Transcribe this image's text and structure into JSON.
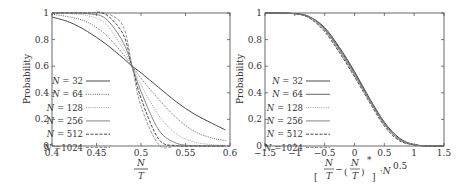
{
  "chart_data": [
    {
      "type": "line",
      "title": "",
      "xlabel": "N / T",
      "ylabel": "Probability",
      "xlim": [
        0.4,
        0.6
      ],
      "ylim": [
        0,
        1
      ],
      "xticks": [
        "0.4",
        "0.45",
        "0.5",
        "0.55",
        "0.6"
      ],
      "yticks": [
        "0",
        "0.2",
        "0.4",
        "0.6",
        "0.8",
        "1"
      ],
      "grid": false,
      "legend_position": "lower left",
      "x": [
        0.4,
        0.42,
        0.44,
        0.46,
        0.48,
        0.49,
        0.5,
        0.52,
        0.54,
        0.56,
        0.58,
        0.595
      ],
      "series": [
        {
          "name": "N = 32",
          "style": "solid",
          "color": "#333333",
          "values": [
            0.97,
            0.93,
            0.86,
            0.77,
            0.66,
            0.6,
            0.55,
            0.44,
            0.33,
            0.24,
            0.17,
            0.12
          ]
        },
        {
          "name": "N = 64",
          "style": "dotted",
          "color": "#555555",
          "values": [
            0.99,
            0.97,
            0.93,
            0.84,
            0.69,
            0.6,
            0.51,
            0.35,
            0.21,
            0.11,
            0.06,
            0.04
          ]
        },
        {
          "name": "N = 128",
          "style": "dotted",
          "color": "#999999",
          "values": [
            1.0,
            0.995,
            0.98,
            0.92,
            0.73,
            0.6,
            0.46,
            0.23,
            0.09,
            0.03,
            0.01,
            0.005
          ]
        },
        {
          "name": "N = 256",
          "style": "solid",
          "color": "#777777",
          "values": [
            1.0,
            1.0,
            0.995,
            0.96,
            0.78,
            0.6,
            0.41,
            0.12,
            0.02,
            0.003,
            0.0,
            0.0
          ]
        },
        {
          "name": "N = 512",
          "style": "dashed",
          "color": "#333333",
          "values": [
            1.0,
            1.0,
            1.0,
            0.99,
            0.84,
            0.6,
            0.36,
            0.05,
            0.003,
            0.0,
            0.0,
            0.0
          ]
        },
        {
          "name": "N = 1024",
          "style": "dashed",
          "color": "#888888",
          "values": [
            1.0,
            1.0,
            1.0,
            1.0,
            0.9,
            0.6,
            0.3,
            0.01,
            0.0,
            0.0,
            0.0,
            0.0
          ]
        }
      ]
    },
    {
      "type": "line",
      "title": "",
      "xlabel": "[ N/T − (N/T)* ] · N^0.5",
      "ylabel": "Probability",
      "xlim": [
        -1.5,
        1.5
      ],
      "ylim": [
        0,
        1
      ],
      "xticks": [
        "−1.5",
        "−1",
        "−0.5",
        "0",
        "0.5",
        "1",
        "1.5"
      ],
      "yticks": [
        "0",
        "0.2",
        "0.4",
        "0.6",
        "0.8",
        "1"
      ],
      "grid": false,
      "legend_position": "lower left",
      "x": [
        -1.5,
        -1.0,
        -0.75,
        -0.5,
        -0.25,
        0.0,
        0.25,
        0.5,
        0.75,
        1.0,
        1.25,
        1.5
      ],
      "series": [
        {
          "name": "N = 32",
          "style": "solid",
          "color": "#333333",
          "values": [
            1.0,
            0.995,
            0.97,
            0.89,
            0.74,
            0.56,
            0.36,
            0.18,
            0.06,
            0.01,
            0.0,
            0.0
          ]
        },
        {
          "name": "N = 64",
          "style": "solid",
          "color": "#555555",
          "values": [
            1.0,
            0.995,
            0.97,
            0.88,
            0.73,
            0.55,
            0.35,
            0.17,
            0.05,
            0.01,
            0.0,
            0.0
          ]
        },
        {
          "name": "N = 128",
          "style": "dotted",
          "color": "#999999",
          "values": [
            1.0,
            0.995,
            0.96,
            0.87,
            0.71,
            0.53,
            0.34,
            0.16,
            0.05,
            0.01,
            0.0,
            0.0
          ]
        },
        {
          "name": "N = 256",
          "style": "solid",
          "color": "#777777",
          "values": [
            1.0,
            0.995,
            0.97,
            0.88,
            0.72,
            0.54,
            0.35,
            0.17,
            0.05,
            0.01,
            0.0,
            0.0
          ]
        },
        {
          "name": "N = 512",
          "style": "dashed",
          "color": "#333333",
          "values": [
            1.0,
            0.995,
            0.96,
            0.86,
            0.7,
            0.52,
            0.33,
            0.15,
            0.04,
            0.01,
            0.0,
            0.0
          ]
        },
        {
          "name": "N = 1024",
          "style": "dashed",
          "color": "#888888",
          "values": [
            1.0,
            0.995,
            0.96,
            0.87,
            0.71,
            0.53,
            0.34,
            0.16,
            0.05,
            0.01,
            0.0,
            0.0
          ]
        }
      ]
    }
  ],
  "panels": {
    "left": {
      "ylabel": "Probability",
      "xlabel_num": "N",
      "xlabel_den": "T",
      "legend": [
        {
          "prefix": "N",
          "text": " = 32"
        },
        {
          "prefix": "N",
          "text": " = 64"
        },
        {
          "prefix": "N",
          "text": " = 128"
        },
        {
          "prefix": "N",
          "text": " = 256"
        },
        {
          "prefix": "N",
          "text": " = 512"
        },
        {
          "prefix": "N",
          "text": " =1024"
        }
      ]
    },
    "right": {
      "ylabel": "Probability",
      "xlabel_parts": {
        "frac1_num": "N",
        "frac1_den": "T",
        "minus": "−",
        "frac2_num": "N",
        "frac2_den": "T",
        "star": "*",
        "suffix_base": "·N",
        "suffix_exp": "0.5"
      },
      "legend": [
        {
          "prefix": "N",
          "text": " = 32"
        },
        {
          "prefix": "N",
          "text": " = 64"
        },
        {
          "prefix": "N",
          "text": " = 128"
        },
        {
          "prefix": "N",
          "text": " = 256"
        },
        {
          "prefix": "N",
          "text": " = 512"
        },
        {
          "prefix": "N",
          "text": " =1024"
        }
      ]
    }
  }
}
